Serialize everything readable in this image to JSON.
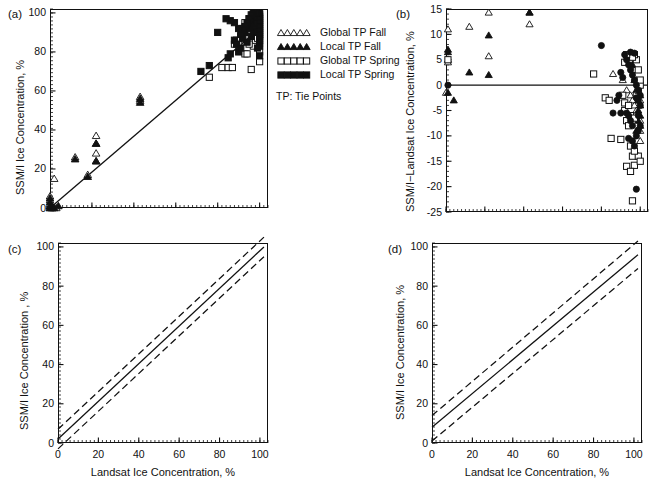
{
  "figure": {
    "panels": [
      "(a)",
      "(b)",
      "(c)",
      "(d)"
    ],
    "xlabel": "Landsat Ice Concentration, %",
    "ylabel_a": "SSM/I Ice Concentration, %",
    "ylabel_b": "SSM/I−Landsat Ice Concentration, %",
    "ylabel_c": "SSM/I Ice Concentration , %",
    "ylabel_d": "SSM/I Ice Concentration, %"
  },
  "legend": {
    "note": "TP: Tie Points",
    "items": [
      {
        "label": "Global TP Fall",
        "marker": "open-triangle"
      },
      {
        "label": "Local TP Fall",
        "marker": "filled-triangle"
      },
      {
        "label": "Global TP Spring",
        "marker": "open-square"
      },
      {
        "label": "Local TP Spring",
        "marker": "filled-square"
      }
    ]
  },
  "chart_data": [
    {
      "type": "scatter",
      "panel": "(a)",
      "title": "",
      "xlabel": "Landsat Ice Concentration, %",
      "ylabel": "SSM/I Ice Concentration, %",
      "xlim": [
        0,
        104
      ],
      "ylim": [
        0,
        102
      ],
      "xticks": [
        0,
        20,
        40,
        60,
        80,
        100
      ],
      "yticks": [
        0,
        20,
        40,
        60,
        80,
        100
      ],
      "xtick_labels_shown": false,
      "grid": false,
      "fit_line": {
        "x": [
          0,
          100
        ],
        "y": [
          0,
          92
        ]
      },
      "series": [
        {
          "name": "Global TP Fall",
          "marker": "open-triangle",
          "points": [
            [
              0,
              0
            ],
            [
              0,
              1
            ],
            [
              0,
              2
            ],
            [
              0,
              4
            ],
            [
              0,
              6
            ],
            [
              1,
              0
            ],
            [
              2,
              15
            ],
            [
              3,
              0
            ],
            [
              12,
              26
            ],
            [
              18,
              17
            ],
            [
              22,
              37
            ],
            [
              22,
              33
            ],
            [
              22,
              28
            ],
            [
              22,
              24
            ],
            [
              43,
              57
            ],
            [
              43,
              55
            ]
          ]
        },
        {
          "name": "Local TP Fall",
          "marker": "filled-triangle",
          "points": [
            [
              0,
              0
            ],
            [
              0,
              1
            ],
            [
              0,
              3
            ],
            [
              0,
              5
            ],
            [
              1,
              0
            ],
            [
              2,
              0
            ],
            [
              4,
              1
            ],
            [
              12,
              25
            ],
            [
              18,
              16
            ],
            [
              22,
              33
            ],
            [
              22,
              24
            ],
            [
              43,
              56
            ],
            [
              43,
              54
            ]
          ]
        },
        {
          "name": "Global TP Spring",
          "marker": "open-square",
          "points": [
            [
              76,
              67
            ],
            [
              82,
              72
            ],
            [
              85,
              72
            ],
            [
              87,
              72
            ],
            [
              90,
              84
            ],
            [
              93,
              79
            ],
            [
              94,
              79
            ],
            [
              96,
              71
            ],
            [
              97,
              83
            ],
            [
              98,
              86
            ],
            [
              98,
              90
            ],
            [
              99,
              93
            ],
            [
              99,
              96
            ],
            [
              100,
              75
            ],
            [
              100,
              80
            ],
            [
              100,
              84
            ],
            [
              100,
              87
            ],
            [
              100,
              89
            ],
            [
              100,
              91
            ],
            [
              100,
              93
            ],
            [
              100,
              95
            ],
            [
              100,
              97
            ],
            [
              100,
              99
            ],
            [
              97,
              99
            ],
            [
              95,
              97
            ],
            [
              93,
              95
            ],
            [
              92,
              92
            ],
            [
              91,
              88
            ],
            [
              89,
              86
            ],
            [
              88,
              84
            ],
            [
              95,
              84
            ],
            [
              97,
              88
            ],
            [
              98,
              95
            ],
            [
              99,
              87
            ]
          ]
        },
        {
          "name": "Local TP Spring",
          "marker": "filled-square",
          "points": [
            [
              72,
              70
            ],
            [
              76,
              73
            ],
            [
              80,
              90
            ],
            [
              85,
              77
            ],
            [
              86,
              79
            ],
            [
              88,
              86
            ],
            [
              89,
              84
            ],
            [
              90,
              80
            ],
            [
              91,
              82
            ],
            [
              92,
              87
            ],
            [
              93,
              90
            ],
            [
              94,
              85
            ],
            [
              95,
              92
            ],
            [
              96,
              88
            ],
            [
              96,
              94
            ],
            [
              97,
              91
            ],
            [
              97,
              96
            ],
            [
              98,
              93
            ],
            [
              98,
              97
            ],
            [
              99,
              90
            ],
            [
              99,
              95
            ],
            [
              99,
              98
            ],
            [
              100,
              83
            ],
            [
              100,
              86
            ],
            [
              100,
              88
            ],
            [
              100,
              90
            ],
            [
              100,
              92
            ],
            [
              100,
              94
            ],
            [
              100,
              96
            ],
            [
              100,
              98
            ],
            [
              100,
              100
            ],
            [
              99,
              100
            ],
            [
              98,
              100
            ],
            [
              97,
              100
            ],
            [
              96,
              99
            ],
            [
              95,
              97
            ],
            [
              94,
              95
            ],
            [
              93,
              93
            ],
            [
              92,
              91
            ],
            [
              91,
              89
            ],
            [
              90,
              92
            ],
            [
              88,
              95
            ],
            [
              86,
              96
            ],
            [
              84,
              97
            ],
            [
              99,
              82
            ],
            [
              100,
              78
            ]
          ]
        }
      ]
    },
    {
      "type": "scatter",
      "panel": "(b)",
      "title": "",
      "xlabel": "Landsat Ice Concentration, %",
      "ylabel": "SSM/I−Landsat Ice Concentration, %",
      "xlim": [
        0,
        104
      ],
      "ylim": [
        -25,
        15
      ],
      "xticks": [
        0,
        20,
        40,
        60,
        80,
        100
      ],
      "yticks": [
        15,
        10,
        5,
        0,
        -5,
        -10,
        -15,
        -20,
        -25
      ],
      "xtick_labels_shown": false,
      "grid": false,
      "zero_line": 0,
      "series": [
        {
          "name": "Global TP Fall",
          "marker": "open-triangle",
          "points": [
            [
              1,
              11
            ],
            [
              1,
              4.5
            ],
            [
              1,
              5
            ],
            [
              12,
              11.5
            ],
            [
              22,
              14.3
            ],
            [
              22,
              5.7
            ],
            [
              43,
              14.3
            ],
            [
              43,
              12
            ],
            [
              0,
              -1.5
            ],
            [
              86,
              2.2
            ],
            [
              91,
              1
            ],
            [
              93,
              -1
            ],
            [
              95,
              -2
            ],
            [
              96,
              -3
            ],
            [
              97,
              -4
            ],
            [
              98,
              -5
            ],
            [
              99,
              -6
            ],
            [
              100,
              -7
            ],
            [
              100,
              -9
            ],
            [
              100,
              -11
            ],
            [
              99,
              -14
            ],
            [
              100,
              -3
            ],
            [
              99,
              0
            ],
            [
              98,
              1
            ],
            [
              97,
              3
            ],
            [
              95,
              5
            ]
          ]
        },
        {
          "name": "Local TP Fall",
          "marker": "filled-triangle",
          "points": [
            [
              1,
              7
            ],
            [
              1,
              6.5
            ],
            [
              1,
              -1.5
            ],
            [
              4,
              -3
            ],
            [
              12,
              2.5
            ],
            [
              22,
              9.8
            ],
            [
              22,
              2
            ],
            [
              43,
              14.3
            ],
            [
              96,
              4
            ],
            [
              97,
              1
            ],
            [
              98,
              -1
            ],
            [
              99,
              -3
            ],
            [
              99,
              -5
            ],
            [
              100,
              -6
            ],
            [
              100,
              -8
            ],
            [
              100,
              -2
            ],
            [
              100,
              -4
            ],
            [
              99,
              -7
            ],
            [
              98,
              -9
            ]
          ]
        },
        {
          "name": "Global TP Spring",
          "marker": "open-square",
          "points": [
            [
              1,
              5
            ],
            [
              76,
              2.2
            ],
            [
              82,
              -2.5
            ],
            [
              84,
              -3
            ],
            [
              85,
              -10.5
            ],
            [
              90,
              -10.7
            ],
            [
              92,
              -5
            ],
            [
              93,
              -7
            ],
            [
              94,
              -8
            ],
            [
              95,
              -12
            ],
            [
              96,
              -14
            ],
            [
              97,
              -15.8
            ],
            [
              93,
              -16
            ],
            [
              95,
              -17
            ],
            [
              96,
              -22.8
            ],
            [
              91,
              -2
            ],
            [
              92,
              -3.5
            ],
            [
              94,
              -4
            ],
            [
              95,
              -6
            ],
            [
              97,
              -6.5
            ],
            [
              98,
              -2
            ],
            [
              99,
              -1
            ],
            [
              100,
              0
            ],
            [
              100,
              1
            ],
            [
              99,
              3
            ],
            [
              98,
              5
            ],
            [
              97,
              6
            ],
            [
              96,
              5.5
            ],
            [
              93,
              6
            ],
            [
              92,
              4.5
            ],
            [
              99,
              -14
            ],
            [
              100,
              -15
            ],
            [
              97,
              -13
            ]
          ]
        },
        {
          "name": "Local TP Spring",
          "marker": "filled-circle",
          "points": [
            [
              1,
              0
            ],
            [
              80,
              7.8
            ],
            [
              86,
              -5.5
            ],
            [
              90,
              -5.5
            ],
            [
              93,
              -5.5
            ],
            [
              94,
              -6
            ],
            [
              95,
              -7
            ],
            [
              96,
              -8
            ],
            [
              94,
              -10.5
            ],
            [
              96,
              -11
            ],
            [
              97,
              -12
            ],
            [
              98,
              -20.5
            ],
            [
              92,
              6
            ],
            [
              93,
              5
            ],
            [
              94,
              4
            ],
            [
              95,
              3
            ],
            [
              96,
              2
            ],
            [
              97,
              1
            ],
            [
              98,
              0
            ],
            [
              99,
              -1
            ],
            [
              100,
              -2
            ],
            [
              100,
              -4
            ],
            [
              99,
              -3
            ],
            [
              98,
              -2.5
            ],
            [
              91,
              1.5
            ],
            [
              90,
              2.5
            ],
            [
              89,
              -2
            ],
            [
              88,
              -3
            ],
            [
              97,
              6.3
            ],
            [
              95,
              6.5
            ],
            [
              99,
              -6
            ],
            [
              100,
              -8
            ],
            [
              99,
              -9
            ],
            [
              98,
              -10
            ]
          ]
        }
      ]
    },
    {
      "type": "line",
      "panel": "(c)",
      "title": "",
      "xlabel": "Landsat Ice Concentration, %",
      "ylabel": "SSM/I Ice Concentration , %",
      "xlim": [
        0,
        104
      ],
      "ylim": [
        0,
        102
      ],
      "xticks": [
        0,
        20,
        40,
        60,
        80,
        100
      ],
      "yticks": [
        0,
        20,
        40,
        60,
        80,
        100
      ],
      "grid": false,
      "lines": [
        {
          "name": "regression",
          "style": "solid",
          "x": [
            0,
            102
          ],
          "y": [
            2,
            100
          ]
        },
        {
          "name": "upper-confidence-band",
          "style": "dashed",
          "x": [
            0,
            102
          ],
          "y": [
            7,
            105
          ]
        },
        {
          "name": "lower-confidence-band",
          "style": "dashed",
          "x": [
            0,
            102
          ],
          "y": [
            -3,
            95
          ]
        }
      ]
    },
    {
      "type": "line",
      "panel": "(d)",
      "title": "",
      "xlabel": "Landsat Ice Concentration, %",
      "ylabel": "SSM/I Ice Concentration, %",
      "xlim": [
        0,
        104
      ],
      "ylim": [
        0,
        102
      ],
      "xticks": [
        0,
        20,
        40,
        60,
        80,
        100
      ],
      "yticks": [
        0,
        20,
        40,
        60,
        80,
        100
      ],
      "grid": false,
      "lines": [
        {
          "name": "regression",
          "style": "solid",
          "x": [
            0,
            102
          ],
          "y": [
            8,
            96
          ]
        },
        {
          "name": "upper-confidence-band",
          "style": "dashed",
          "x": [
            0,
            102
          ],
          "y": [
            14,
            103
          ]
        },
        {
          "name": "lower-confidence-band",
          "style": "dashed",
          "x": [
            0,
            102
          ],
          "y": [
            1,
            89
          ]
        }
      ]
    }
  ]
}
